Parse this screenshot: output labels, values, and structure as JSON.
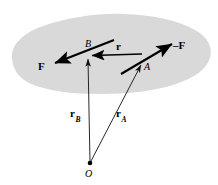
{
  "figure": {
    "kind": "free-body-diagram",
    "colors": {
      "background": "#ffffff",
      "body_fill": "#d9d9d9",
      "line": "#000000",
      "thin_line": "#1a1a1a"
    },
    "labels": {
      "force_f": "F",
      "force_minus_f": "–F",
      "vector_r": "r",
      "vector_r_b": "r",
      "vector_r_b_sub": "B",
      "vector_r_a": "r",
      "vector_r_a_sub": "A",
      "point_a": "A",
      "point_b": "B",
      "origin": "O"
    },
    "points": {
      "A": {
        "x": 142,
        "y": 62
      },
      "B": {
        "x": 88,
        "y": 56
      },
      "O": {
        "x": 90,
        "y": 163
      }
    }
  }
}
